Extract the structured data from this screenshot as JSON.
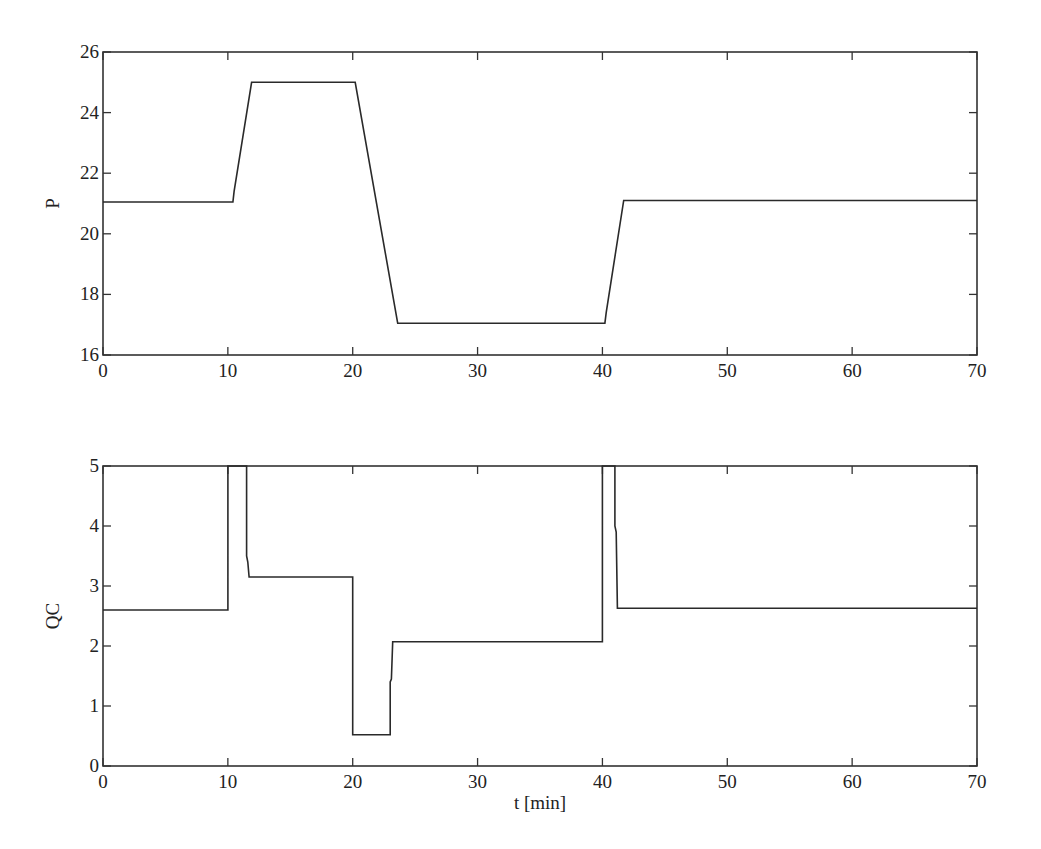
{
  "chart_data": [
    {
      "type": "line",
      "title": "",
      "xlabel": "",
      "ylabel": "P",
      "xlim": [
        0,
        70
      ],
      "ylim": [
        16,
        26
      ],
      "xticks": [
        0,
        10,
        20,
        30,
        40,
        50,
        60,
        70
      ],
      "yticks": [
        16,
        18,
        20,
        22,
        24,
        26
      ],
      "grid": false,
      "legend": null,
      "series": [
        {
          "name": "P",
          "x": [
            0,
            10.4,
            10.5,
            11.9,
            20.2,
            23.6,
            40.2,
            40.3,
            41.7,
            70
          ],
          "y": [
            21.05,
            21.05,
            21.4,
            25.0,
            25.0,
            17.05,
            17.05,
            17.4,
            21.1,
            21.1
          ]
        }
      ]
    },
    {
      "type": "line",
      "title": "",
      "xlabel": "t [min]",
      "ylabel": "QC",
      "xlim": [
        0,
        70
      ],
      "ylim": [
        0,
        5
      ],
      "xticks": [
        0,
        10,
        20,
        30,
        40,
        50,
        60,
        70
      ],
      "yticks": [
        0,
        1,
        2,
        3,
        4,
        5
      ],
      "grid": false,
      "legend": null,
      "series": [
        {
          "name": "QC",
          "x": [
            0,
            10.0,
            10.0,
            11.5,
            11.5,
            11.6,
            11.7,
            20.0,
            20.0,
            23.0,
            23.0,
            23.1,
            23.2,
            40.0,
            40.0,
            41.0,
            41.0,
            41.1,
            41.2,
            70
          ],
          "y": [
            2.6,
            2.6,
            5.0,
            5.0,
            3.5,
            3.4,
            3.15,
            3.15,
            0.52,
            0.52,
            1.4,
            1.45,
            2.07,
            2.07,
            5.0,
            5.0,
            4.0,
            3.9,
            2.63,
            2.63
          ]
        }
      ]
    }
  ],
  "plots": {
    "top": {
      "ylabel": "P",
      "xticks": [
        "0",
        "10",
        "20",
        "30",
        "40",
        "50",
        "60",
        "70"
      ],
      "yticks": [
        "16",
        "18",
        "20",
        "22",
        "24",
        "26"
      ]
    },
    "bottom": {
      "ylabel": "QC",
      "xlabel": "t [min]",
      "xticks": [
        "0",
        "10",
        "20",
        "30",
        "40",
        "50",
        "60",
        "70"
      ],
      "yticks": [
        "0",
        "1",
        "2",
        "3",
        "4",
        "5"
      ]
    }
  }
}
